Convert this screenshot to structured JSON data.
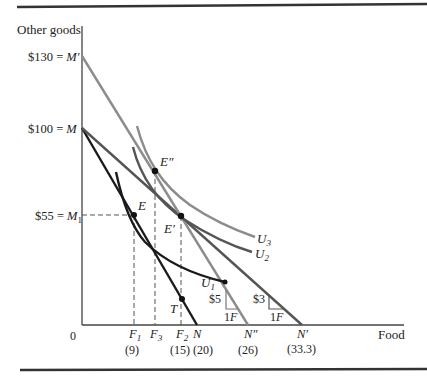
{
  "figure": {
    "y_axis_label": "Other goods",
    "x_axis_label": "Food",
    "origin_label": "0",
    "y_ticks": [
      {
        "label": "$130 = M′",
        "value": 130
      },
      {
        "label": "$100 = M",
        "value": 100
      },
      {
        "label": "$55 = M",
        "sub": "1",
        "value": 55
      }
    ],
    "x_ticks": [
      {
        "name": "F",
        "sub": "1",
        "value_label": "(9)"
      },
      {
        "name": "F",
        "sub": "3",
        "value_label": ""
      },
      {
        "name": "F",
        "sub": "2",
        "value_label": "(15)"
      },
      {
        "name": "N",
        "sub": "",
        "value_label": "(20)"
      },
      {
        "name": "N″",
        "sub": "",
        "value_label": "(26)"
      },
      {
        "name": "N′",
        "sub": "",
        "value_label": "(33.3)"
      }
    ],
    "points": {
      "E": "E",
      "E_prime": "E′",
      "E_double": "E″",
      "T": "T"
    },
    "curves": {
      "U1": "U",
      "U1_sub": "1",
      "U2": "U",
      "U2_sub": "2",
      "U3": "U",
      "U3_sub": "3"
    },
    "slope_triangles": [
      {
        "rise": "$5",
        "run": "1F"
      },
      {
        "rise": "$3",
        "run": "1F"
      }
    ],
    "colors": {
      "dark": "#1a1a1a",
      "medium": "#555555",
      "light": "#8c8c8c",
      "axis": "#444444"
    }
  }
}
